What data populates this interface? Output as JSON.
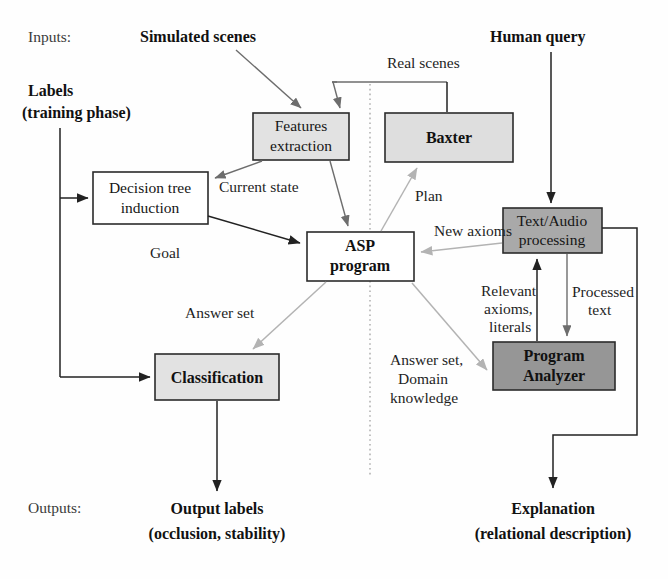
{
  "figure": {
    "type": "architecture-flow-diagram",
    "side_labels": {
      "inputs": "Inputs:",
      "outputs": "Outputs:"
    }
  },
  "inputs": [
    {
      "id": "simulated-scenes",
      "text": "Simulated scenes",
      "bold": true
    },
    {
      "id": "labels",
      "line1": "Labels",
      "line2": "(training phase)",
      "bold": true
    },
    {
      "id": "human-query",
      "text": "Human query",
      "bold": true
    }
  ],
  "nodes": [
    {
      "id": "features-extraction",
      "line1": "Features",
      "line2": "extraction",
      "fill": "#e2e2e2",
      "bold": false
    },
    {
      "id": "baxter",
      "line1": "Baxter",
      "line2": "",
      "fill": "#dedede",
      "bold": true
    },
    {
      "id": "decision-tree-induction",
      "line1": "Decision tree",
      "line2": "induction",
      "fill": "#ffffff",
      "bold": false
    },
    {
      "id": "asp-program",
      "line1": "ASP",
      "line2": "program",
      "fill": "#ffffff",
      "bold": true
    },
    {
      "id": "text-audio-processing",
      "line1": "Text/Audio",
      "line2": "processing",
      "fill": "#a9a9a9",
      "bold": false
    },
    {
      "id": "classification",
      "line1": "Classification",
      "line2": "",
      "fill": "#e2e2e2",
      "bold": true
    },
    {
      "id": "program-analyzer",
      "line1": "Program",
      "line2": "Analyzer",
      "fill": "#969696",
      "bold": true
    }
  ],
  "edge_labels": [
    {
      "id": "real-scenes",
      "text": "Real scenes"
    },
    {
      "id": "current-state",
      "text": "Current state"
    },
    {
      "id": "plan",
      "text": "Plan"
    },
    {
      "id": "goal",
      "text": "Goal"
    },
    {
      "id": "new-axioms",
      "text": "New axioms"
    },
    {
      "id": "answer-set",
      "text": "Answer set"
    },
    {
      "id": "relevant-axioms-literals",
      "line1": "Relevant",
      "line2": "axioms,",
      "line3": "literals"
    },
    {
      "id": "processed-text",
      "line1": "Processed",
      "line2": "text"
    },
    {
      "id": "answer-set-domain-knowledge",
      "line1": "Answer set,",
      "line2": "Domain",
      "line3": "knowledge"
    }
  ],
  "outputs": [
    {
      "id": "output-labels",
      "line1": "Output labels",
      "line2": "(occlusion, stability)",
      "bold": true
    },
    {
      "id": "explanation",
      "line1": "Explanation",
      "line2": "(relational description)",
      "bold": true
    }
  ],
  "colors": {
    "light_gray_fill": "#e2e2e2",
    "mid_gray_fill": "#a9a9a9",
    "dark_gray_fill": "#969696",
    "white_fill": "#ffffff",
    "stroke_dark": "#222222",
    "stroke_light": "#b3b3b3",
    "divider": "#9a9a9a"
  }
}
